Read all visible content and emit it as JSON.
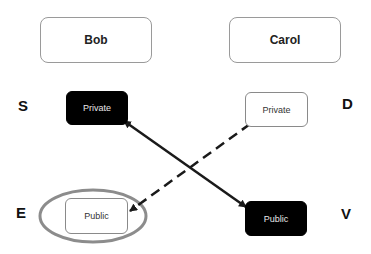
{
  "parties": {
    "left": {
      "label": "Bob"
    },
    "right": {
      "label": "Carol"
    }
  },
  "keys": {
    "s": {
      "letter": "S",
      "label": "Private",
      "style": "dark"
    },
    "d": {
      "letter": "D",
      "label": "Private",
      "style": "light"
    },
    "e": {
      "letter": "E",
      "label": "Public",
      "style": "light",
      "highlighted": true
    },
    "v": {
      "letter": "V",
      "label": "Public",
      "style": "dark"
    }
  },
  "arrows": [
    {
      "from": "S-Private",
      "to": "V-Public",
      "style": "solid",
      "direction": "bidirectional"
    },
    {
      "from": "D-Private",
      "to": "E-Public",
      "style": "dashed",
      "direction": "to-E"
    }
  ],
  "colors": {
    "dark_box": "#000000",
    "light_border": "#8a8a8a",
    "highlight_ellipse": "#8c8c8c",
    "arrow": "#1a1a1a"
  }
}
